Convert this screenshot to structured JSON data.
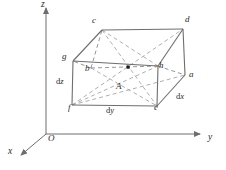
{
  "figure": {
    "type": "3d-box-diagram",
    "colors": {
      "background": "#ffffff",
      "solid_edge": "#6e6e6e",
      "hidden_edge": "#8a8a8a",
      "diagonal": "#9a9a9a",
      "axis": "#6e6e6e",
      "label_text": "#2b2b2b",
      "center_point": "#1a1a1a"
    },
    "axes": [
      {
        "id": "z",
        "label": "z",
        "label_x": 41,
        "label_y": 1,
        "direction": "up"
      },
      {
        "id": "y",
        "label": "y",
        "label_x": 208,
        "label_y": 134,
        "direction": "right"
      },
      {
        "id": "x",
        "label": "x",
        "label_x": 8,
        "label_y": 148,
        "direction": "down-left"
      }
    ],
    "origin": {
      "label": "O",
      "label_x": 48,
      "label_y": 135
    },
    "vertices": [
      {
        "id": "c",
        "label": "c",
        "label_x": 92,
        "label_y": 17
      },
      {
        "id": "d",
        "label": "d",
        "label_x": 185,
        "label_y": 16
      },
      {
        "id": "g",
        "label": "g",
        "label_x": 62,
        "label_y": 53
      },
      {
        "id": "b",
        "label": "b",
        "label_x": 85,
        "label_y": 65
      },
      {
        "id": "h",
        "label": "h",
        "label_x": 159,
        "label_y": 62
      },
      {
        "id": "a",
        "label": "a",
        "label_x": 189,
        "label_y": 71
      },
      {
        "id": "f",
        "label": "f",
        "label_x": 68,
        "label_y": 104
      },
      {
        "id": "e",
        "label": "e",
        "label_x": 154,
        "label_y": 104
      }
    ],
    "dimension_labels": [
      {
        "id": "dz",
        "text_prefix": "d",
        "text_var": "z",
        "label_x": 56,
        "label_y": 78
      },
      {
        "id": "dy",
        "text_prefix": "d",
        "text_var": "y",
        "label_x": 106,
        "label_y": 107
      },
      {
        "id": "dx",
        "text_prefix": "d",
        "text_var": "x",
        "label_x": 176,
        "label_y": 93
      }
    ],
    "area_label": {
      "id": "A",
      "label": "A",
      "label_x": 116,
      "label_y": 83
    },
    "center_point": {
      "x": 128,
      "y": 67,
      "size": 3
    }
  }
}
